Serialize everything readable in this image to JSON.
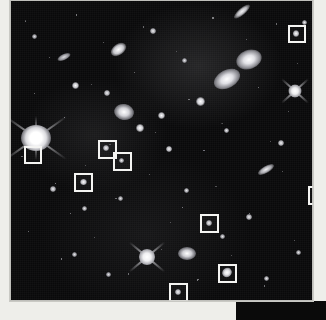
{
  "view": {
    "type": "astronomical-deep-field-image",
    "title": "Deep field galaxy cluster image with marked objects",
    "width": 326,
    "height": 320
  },
  "colors": {
    "page_background": "#eeeeea",
    "sky_background": "#09090a",
    "marker_stroke": "#f4f4f2",
    "source_white": "#ffffff",
    "panel_dark": "#0a0a0a"
  },
  "plate": {
    "left": 10,
    "top": 0,
    "width": 303,
    "height": 301
  },
  "markers": [
    {
      "id": "box-1",
      "label": "",
      "left": 278,
      "top": 25,
      "size": 18
    },
    {
      "id": "box-2",
      "label": "",
      "left": 14,
      "top": 146,
      "size": 18
    },
    {
      "id": "box-3",
      "label": "",
      "left": 88,
      "top": 140,
      "size": 19
    },
    {
      "id": "box-4",
      "label": "",
      "left": 103,
      "top": 152,
      "size": 19
    },
    {
      "id": "box-5",
      "label": "",
      "left": 64,
      "top": 173,
      "size": 19
    },
    {
      "id": "box-6",
      "label": "",
      "left": 298,
      "top": 186,
      "size": 19
    },
    {
      "id": "box-7",
      "label": "",
      "left": 190,
      "top": 214,
      "size": 19
    },
    {
      "id": "box-8",
      "label": "",
      "left": 208,
      "top": 264,
      "size": 19
    },
    {
      "id": "box-9",
      "label": "",
      "left": 159,
      "top": 283,
      "size": 19
    }
  ],
  "bright_stars": [
    {
      "id": "star-left-edge",
      "left": 6,
      "top": 118,
      "size": 34,
      "spikes": 4,
      "brightness": "very-high"
    },
    {
      "id": "star-lower-mid",
      "left": 125,
      "top": 245,
      "size": 22,
      "spikes": 4,
      "brightness": "high"
    },
    {
      "id": "star-upper-right",
      "left": 276,
      "top": 82,
      "size": 18,
      "spikes": 4,
      "brightness": "high"
    }
  ],
  "galaxies": [
    {
      "id": "g-elliptical-bright-1",
      "left": 228,
      "top": 52,
      "w": 24,
      "h": 18,
      "angle": -20
    },
    {
      "id": "g-elliptical-bright-2",
      "left": 205,
      "top": 72,
      "w": 26,
      "h": 16,
      "angle": -28
    },
    {
      "id": "g-edge-on-top",
      "left": 222,
      "top": 8,
      "w": 20,
      "h": 7,
      "angle": -40
    },
    {
      "id": "g-spiral-center",
      "left": 106,
      "top": 108,
      "w": 18,
      "h": 14,
      "angle": 10
    },
    {
      "id": "g-lenticular-mid",
      "left": 100,
      "top": 44,
      "w": 16,
      "h": 10,
      "angle": -35
    },
    {
      "id": "g-edge-on-right",
      "left": 248,
      "top": 168,
      "w": 16,
      "h": 6,
      "angle": -30
    },
    {
      "id": "g-diffuse-lower",
      "left": 170,
      "top": 249,
      "w": 16,
      "h": 11,
      "angle": 0
    },
    {
      "id": "g-faint-left",
      "left": 48,
      "top": 55,
      "w": 13,
      "h": 6,
      "angle": -25
    }
  ],
  "footer": {
    "caption_strip_visible": true,
    "dark_panel_visible": true
  }
}
